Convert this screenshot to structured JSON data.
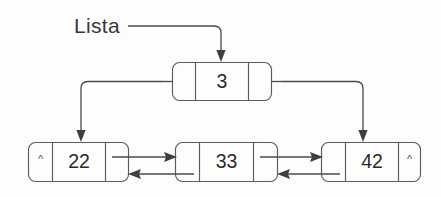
{
  "diagram": {
    "title": "Lista",
    "kind": "doubly-linked-list",
    "pointer_label": "Lista",
    "nil_marker": "^",
    "colors": {
      "background": "#fdfdfd",
      "node_stroke": "#5c5c5c",
      "node_fill": "#fdfdfd",
      "line": "#4a4a4a",
      "arrow": "#3f3f3f",
      "value_text": "#2b2b2b",
      "label_text": "#383838"
    },
    "head_node": {
      "name": "header-node",
      "value": "3",
      "left_cell": "",
      "right_cell": ""
    },
    "nodes": [
      {
        "name": "node-22",
        "value": "22",
        "left_cell": "^",
        "right_cell": ""
      },
      {
        "name": "node-33",
        "value": "33",
        "left_cell": "",
        "right_cell": ""
      },
      {
        "name": "node-42",
        "value": "42",
        "left_cell": "",
        "right_cell": "^"
      }
    ],
    "links": [
      {
        "name": "lista-to-header",
        "from": "Lista",
        "to": "3",
        "direction": "down"
      },
      {
        "name": "header-left-to-first",
        "from": "3",
        "to": "22",
        "direction": "down"
      },
      {
        "name": "header-right-to-last",
        "from": "3",
        "to": "42",
        "direction": "down"
      },
      {
        "name": "next-22-to-33",
        "from": "22",
        "to": "33",
        "direction": "right"
      },
      {
        "name": "prev-33-to-22",
        "from": "33",
        "to": "22",
        "direction": "left"
      },
      {
        "name": "next-33-to-42",
        "from": "33",
        "to": "42",
        "direction": "right"
      },
      {
        "name": "prev-42-to-33",
        "from": "42",
        "to": "33",
        "direction": "left"
      }
    ]
  }
}
